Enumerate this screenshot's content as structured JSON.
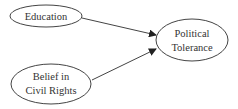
{
  "diagram": {
    "type": "path-diagram",
    "colors": {
      "stroke": "#444444",
      "text": "#333333",
      "background": "#ffffff"
    },
    "nodes": [
      {
        "id": "education",
        "lines": [
          "Education"
        ]
      },
      {
        "id": "belief",
        "lines": [
          "Belief in",
          "Civil Rights"
        ]
      },
      {
        "id": "tolerance",
        "lines": [
          "Political",
          "Tolerance"
        ]
      }
    ],
    "edges": [
      {
        "from": "education",
        "to": "tolerance"
      },
      {
        "from": "belief",
        "to": "tolerance"
      }
    ]
  }
}
